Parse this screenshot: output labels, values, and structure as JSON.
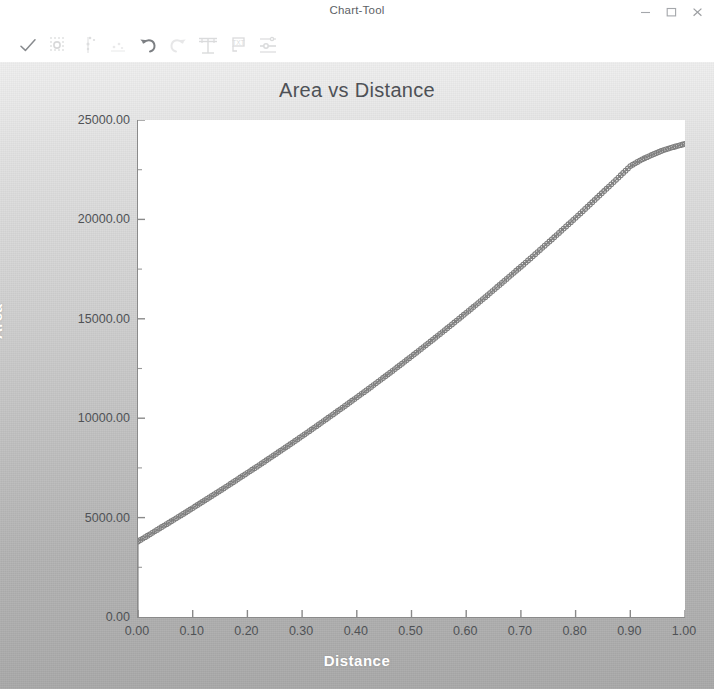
{
  "window": {
    "title": "Chart-Tool",
    "controls": [
      {
        "name": "minimize-button",
        "icon": "minimize-icon",
        "label": "–"
      },
      {
        "name": "maximize-button",
        "icon": "maximize-icon",
        "label": "□"
      },
      {
        "name": "close-button",
        "icon": "close-icon",
        "label": "×"
      }
    ]
  },
  "toolbar": {
    "items": [
      {
        "name": "apply-button",
        "icon": "checkmark-icon",
        "label": "Apply"
      },
      {
        "name": "marker-style-button",
        "icon": "circle-marker-icon",
        "label": "Marker Style"
      },
      {
        "name": "scatter-plot-button",
        "icon": "scatter-points-icon",
        "label": "Scatter"
      },
      {
        "name": "data-points-button",
        "icon": "data-points-icon",
        "label": "Data Points"
      },
      {
        "name": "undo-button",
        "icon": "undo-arrow-icon",
        "label": "Undo"
      },
      {
        "name": "redo-button",
        "icon": "redo-arrow-icon",
        "label": "Redo"
      },
      {
        "name": "grid-button",
        "icon": "grid-axis-icon",
        "label": "Grid"
      },
      {
        "name": "text-label-button",
        "icon": "text-box-icon",
        "label": "Text"
      },
      {
        "name": "axis-settings-button",
        "icon": "axis-settings-icon",
        "label": "Axis Settings"
      }
    ]
  },
  "chart_data": {
    "type": "line",
    "title": "Area vs Distance",
    "xlabel": "Distance",
    "ylabel": "Area",
    "xlim": [
      0.0,
      1.0
    ],
    "ylim": [
      0.0,
      25000.0
    ],
    "grid": false,
    "legend": null,
    "marker": "circle-open",
    "line_color": "#888888",
    "x_tick_labels": [
      "0.00",
      "0.10",
      "0.20",
      "0.30",
      "0.40",
      "0.50",
      "0.60",
      "0.70",
      "0.80",
      "0.90",
      "1.00"
    ],
    "x_ticks": [
      0.0,
      0.1,
      0.2,
      0.3,
      0.4,
      0.5,
      0.6,
      0.7,
      0.8,
      0.9,
      1.0
    ],
    "y_tick_labels": [
      "0.00",
      "5000.00",
      "10000.00",
      "15000.00",
      "20000.00",
      "25000.00"
    ],
    "y_ticks": [
      0,
      5000,
      10000,
      15000,
      20000,
      25000
    ],
    "y_minor_ticks": [
      2500,
      7500,
      12500,
      17500,
      22500
    ],
    "series": [
      {
        "name": "Area",
        "x": [
          0.0,
          0.0,
          0.02,
          0.04,
          0.06,
          0.08,
          0.1,
          0.12,
          0.14,
          0.16,
          0.18,
          0.2,
          0.22,
          0.24,
          0.26,
          0.28,
          0.3,
          0.32,
          0.34,
          0.36,
          0.38,
          0.4,
          0.42,
          0.44,
          0.46,
          0.48,
          0.5,
          0.52,
          0.54,
          0.56,
          0.58,
          0.6,
          0.62,
          0.64,
          0.66,
          0.68,
          0.7,
          0.72,
          0.74,
          0.76,
          0.78,
          0.8,
          0.82,
          0.84,
          0.86,
          0.88,
          0.9,
          0.92,
          0.94,
          0.96,
          0.98,
          1.0
        ],
        "y": [
          0,
          3800,
          4130,
          4470,
          4800,
          5140,
          5480,
          5830,
          6180,
          6530,
          6890,
          7250,
          7610,
          7980,
          8350,
          8720,
          9100,
          9480,
          9870,
          10260,
          10650,
          11050,
          11450,
          11860,
          12270,
          12690,
          13110,
          13540,
          13970,
          14410,
          14850,
          15300,
          15750,
          16210,
          16680,
          17150,
          17620,
          18100,
          18590,
          19080,
          19580,
          20080,
          20590,
          21110,
          21630,
          22150,
          22680,
          23000,
          23250,
          23480,
          23650,
          23800
        ]
      }
    ]
  }
}
